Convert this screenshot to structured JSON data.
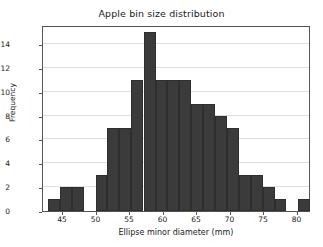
{
  "chart_data": {
    "type": "bar",
    "title": "Apple bin size distribution",
    "xlabel": "Ellipse minor diameter (mm)",
    "ylabel": "Frequency",
    "xlim": [
      42.0,
      82.0
    ],
    "ylim": [
      0,
      15.6
    ],
    "grid": true,
    "legend": null,
    "bar_color": "#3b3b3b",
    "bin_width": 1.77,
    "xticks": [
      45,
      50,
      55,
      60,
      65,
      70,
      75,
      80
    ],
    "yticks": [
      0,
      2,
      4,
      6,
      8,
      10,
      12,
      14
    ],
    "bins": [
      {
        "left": 42.7,
        "right": 44.5,
        "center": 43.6,
        "value": 1
      },
      {
        "left": 44.5,
        "right": 46.3,
        "center": 45.4,
        "value": 2
      },
      {
        "left": 46.3,
        "right": 48.1,
        "center": 47.2,
        "value": 2
      },
      {
        "left": 48.1,
        "right": 49.9,
        "center": 49.0,
        "value": 0
      },
      {
        "left": 49.9,
        "right": 51.6,
        "center": 50.8,
        "value": 3
      },
      {
        "left": 51.6,
        "right": 53.4,
        "center": 52.5,
        "value": 7
      },
      {
        "left": 53.4,
        "right": 55.2,
        "center": 54.3,
        "value": 7
      },
      {
        "left": 55.2,
        "right": 57.0,
        "center": 56.1,
        "value": 11
      },
      {
        "left": 57.0,
        "right": 58.8,
        "center": 57.9,
        "value": 15
      },
      {
        "left": 58.8,
        "right": 60.5,
        "center": 59.7,
        "value": 11
      },
      {
        "left": 60.5,
        "right": 62.3,
        "center": 61.4,
        "value": 11
      },
      {
        "left": 62.3,
        "right": 64.1,
        "center": 63.2,
        "value": 11
      },
      {
        "left": 64.1,
        "right": 65.9,
        "center": 65.0,
        "value": 9
      },
      {
        "left": 65.9,
        "right": 67.7,
        "center": 66.8,
        "value": 9
      },
      {
        "left": 67.7,
        "right": 69.4,
        "center": 68.6,
        "value": 8
      },
      {
        "left": 69.4,
        "right": 71.2,
        "center": 70.3,
        "value": 7
      },
      {
        "left": 71.2,
        "right": 73.0,
        "center": 72.1,
        "value": 3
      },
      {
        "left": 73.0,
        "right": 74.8,
        "center": 73.9,
        "value": 3
      },
      {
        "left": 74.8,
        "right": 76.6,
        "center": 75.7,
        "value": 2
      },
      {
        "left": 76.6,
        "right": 78.3,
        "center": 77.5,
        "value": 1
      },
      {
        "left": 78.3,
        "right": 80.1,
        "center": 79.2,
        "value": 0
      },
      {
        "left": 80.1,
        "right": 81.9,
        "center": 81.0,
        "value": 1
      }
    ]
  }
}
